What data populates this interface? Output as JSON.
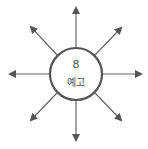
{
  "diagram": {
    "type": "radial-arrows",
    "center": {
      "number": "8",
      "label": "예고"
    },
    "arrow_count": 8,
    "colors": {
      "stroke": "#555555",
      "fill": "#ffffff"
    }
  }
}
